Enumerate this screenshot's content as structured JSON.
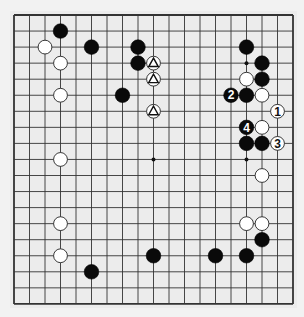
{
  "board": {
    "size": 19,
    "origin": {
      "x": 14,
      "y": 15
    },
    "spacing": {
      "x": 15.5,
      "y": 16.05
    },
    "stone_diameter": 14.6,
    "background": "#ececec",
    "line_color": "#333333",
    "hoshi": [
      [
        3,
        3
      ],
      [
        9,
        3
      ],
      [
        15,
        3
      ],
      [
        3,
        9
      ],
      [
        9,
        9
      ],
      [
        15,
        9
      ],
      [
        3,
        15
      ],
      [
        9,
        15
      ],
      [
        15,
        15
      ]
    ],
    "stones": [
      {
        "color": "black",
        "col": 3,
        "row": 1
      },
      {
        "color": "black",
        "col": 5,
        "row": 2
      },
      {
        "color": "black",
        "col": 8,
        "row": 2
      },
      {
        "color": "black",
        "col": 15,
        "row": 2
      },
      {
        "color": "black",
        "col": 8,
        "row": 3
      },
      {
        "color": "black",
        "col": 16,
        "row": 3
      },
      {
        "color": "black",
        "col": 16,
        "row": 4
      },
      {
        "color": "black",
        "col": 7,
        "row": 5
      },
      {
        "color": "black",
        "col": 14,
        "row": 5,
        "label": "2"
      },
      {
        "color": "black",
        "col": 15,
        "row": 5
      },
      {
        "color": "black",
        "col": 15,
        "row": 7,
        "label": "4"
      },
      {
        "color": "black",
        "col": 15,
        "row": 8
      },
      {
        "color": "black",
        "col": 16,
        "row": 8
      },
      {
        "color": "black",
        "col": 16,
        "row": 14
      },
      {
        "color": "black",
        "col": 9,
        "row": 15
      },
      {
        "color": "black",
        "col": 13,
        "row": 15
      },
      {
        "color": "black",
        "col": 15,
        "row": 15
      },
      {
        "color": "black",
        "col": 5,
        "row": 16
      },
      {
        "color": "white",
        "col": 2,
        "row": 2
      },
      {
        "color": "white",
        "col": 3,
        "row": 3
      },
      {
        "color": "white",
        "col": 9,
        "row": 3,
        "mark": "triangle"
      },
      {
        "color": "white",
        "col": 9,
        "row": 4,
        "mark": "triangle"
      },
      {
        "color": "white",
        "col": 15,
        "row": 4
      },
      {
        "color": "white",
        "col": 3,
        "row": 5
      },
      {
        "color": "white",
        "col": 16,
        "row": 5
      },
      {
        "color": "white",
        "col": 9,
        "row": 6,
        "mark": "triangle"
      },
      {
        "color": "white",
        "col": 17,
        "row": 6,
        "label": "1"
      },
      {
        "color": "white",
        "col": 16,
        "row": 7
      },
      {
        "color": "white",
        "col": 17,
        "row": 8,
        "label": "3"
      },
      {
        "color": "white",
        "col": 3,
        "row": 9
      },
      {
        "color": "white",
        "col": 16,
        "row": 10
      },
      {
        "color": "white",
        "col": 3,
        "row": 13
      },
      {
        "color": "white",
        "col": 15,
        "row": 13
      },
      {
        "color": "white",
        "col": 16,
        "row": 13
      },
      {
        "color": "white",
        "col": 3,
        "row": 15
      }
    ]
  }
}
